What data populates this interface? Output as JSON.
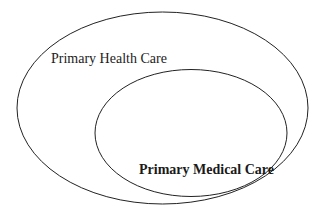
{
  "diagram": {
    "type": "nested-ellipses",
    "outer": {
      "label": "Primary Health Care"
    },
    "inner": {
      "label": "Primary Medical Care"
    },
    "relationship": "Primary Medical Care is a subset of Primary Health Care"
  }
}
